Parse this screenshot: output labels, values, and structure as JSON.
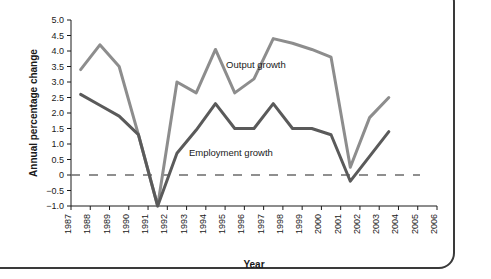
{
  "chart_data": {
    "type": "line",
    "title": "",
    "xlabel": "Year",
    "ylabel": "Annual percentage change",
    "xlim": [
      1987,
      2006
    ],
    "ylim": [
      -1.0,
      5.0
    ],
    "grid": false,
    "legend_position": "inline-annotations",
    "zero_reference_line": {
      "value": 0,
      "style": "dashed",
      "color": "#6b6b6b"
    },
    "x_tick_labels": [
      "1987",
      "1988",
      "1989",
      "1990",
      "1991",
      "1992",
      "1993",
      "1994",
      "1995",
      "1996",
      "1997",
      "1998",
      "1999",
      "2000",
      "2001",
      "2002",
      "2003",
      "2004",
      "2005",
      "2006"
    ],
    "x_tick_rotation": 90,
    "y_tick_labels": [
      "5.0",
      "4.5",
      "4.0",
      "3.5",
      "3.0",
      "2.5",
      "2.0",
      "1.5",
      "1.0",
      "0.5",
      "0",
      "−0.5",
      "−1.0"
    ],
    "y_ticks": [
      5.0,
      4.5,
      4.0,
      3.5,
      3.0,
      2.5,
      2.0,
      1.5,
      1.0,
      0.5,
      0,
      -0.5,
      -1.0
    ],
    "x": [
      1987.5,
      1988.5,
      1989.5,
      1990.5,
      1991.5,
      1992.5,
      1993.5,
      1994.5,
      1995.5,
      1996.5,
      1997.5,
      1998.5,
      1999.5,
      2000.5,
      2001.5,
      2002.5,
      2003.5
    ],
    "series": [
      {
        "name": "Output growth",
        "color": "#8d8d8d",
        "label_x": 1996.6,
        "label_y": 3.45,
        "values": [
          3.4,
          4.2,
          3.5,
          1.3,
          -1.0,
          3.0,
          2.65,
          4.05,
          2.65,
          3.1,
          4.4,
          4.25,
          4.05,
          3.8,
          0.25,
          1.85,
          2.5
        ]
      },
      {
        "name": "Employment growth",
        "color": "#5a5a5a",
        "label_x": 1995.3,
        "label_y": 0.62,
        "values": [
          2.6,
          2.25,
          1.9,
          1.3,
          -1.0,
          0.7,
          1.45,
          2.3,
          1.5,
          1.5,
          2.3,
          1.5,
          1.5,
          1.3,
          -0.2,
          0.6,
          1.4
        ]
      }
    ]
  }
}
